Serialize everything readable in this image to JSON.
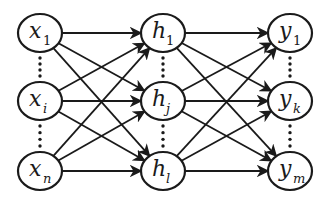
{
  "diagram": {
    "type": "neural-network",
    "colors": {
      "stroke": "#1a1a1a",
      "background": "#ffffff"
    },
    "layers": [
      {
        "name": "input",
        "nodes": [
          {
            "id": "x1",
            "base": "x",
            "sub": "1",
            "sub_italic": false
          },
          {
            "id": "xi",
            "base": "x",
            "sub": "i",
            "sub_italic": true
          },
          {
            "id": "xn",
            "base": "x",
            "sub": "n",
            "sub_italic": true
          }
        ]
      },
      {
        "name": "hidden",
        "nodes": [
          {
            "id": "h1",
            "base": "h",
            "sub": "1",
            "sub_italic": false
          },
          {
            "id": "hj",
            "base": "h",
            "sub": "j",
            "sub_italic": true
          },
          {
            "id": "hl",
            "base": "h",
            "sub": "l",
            "sub_italic": true
          }
        ]
      },
      {
        "name": "output",
        "nodes": [
          {
            "id": "y1",
            "base": "y",
            "sub": "1",
            "sub_italic": false
          },
          {
            "id": "yk",
            "base": "y",
            "sub": "k",
            "sub_italic": true
          },
          {
            "id": "ym",
            "base": "y",
            "sub": "m",
            "sub_italic": true
          }
        ]
      }
    ],
    "connections": "fully-connected",
    "ellipsis": "vertical-dots-between-nodes"
  }
}
